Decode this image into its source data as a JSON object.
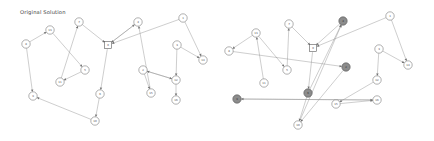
{
  "figure": {
    "width": 434,
    "height": 141,
    "background": "#ffffff",
    "type": "node-link-graph-comparison"
  },
  "colors": {
    "node_fill": "#ffffff",
    "node_stroke": "#6e6e6e",
    "highlight_fill": "#8c8c8c",
    "edge": "#8a8a8a",
    "text": "#3c3c3c",
    "depot_stroke": "#5a5a5a"
  },
  "panels": [
    {
      "id": "left",
      "title": "Original Solution",
      "title_x": 20,
      "title_y": 14,
      "depot": {
        "id": "0",
        "label": "0",
        "x": 108,
        "y": 45
      },
      "nodes": [
        {
          "id": "n7",
          "label": "7",
          "x": 79,
          "y": 22,
          "highlighted": false
        },
        {
          "id": "n13",
          "label": "13",
          "x": 50,
          "y": 30,
          "highlighted": false
        },
        {
          "id": "n8",
          "label": "8",
          "x": 26,
          "y": 44,
          "highlighted": false
        },
        {
          "id": "n9",
          "label": "9",
          "x": 33,
          "y": 96,
          "highlighted": false
        },
        {
          "id": "n10",
          "label": "10",
          "x": 95,
          "y": 121,
          "highlighted": false
        },
        {
          "id": "n5",
          "label": "5",
          "x": 85,
          "y": 70,
          "highlighted": false
        },
        {
          "id": "n11",
          "label": "11",
          "x": 60,
          "y": 82,
          "highlighted": false
        },
        {
          "id": "n6",
          "label": "6",
          "x": 100,
          "y": 94,
          "highlighted": false
        },
        {
          "id": "n4",
          "label": "4",
          "x": 138,
          "y": 22,
          "highlighted": false
        },
        {
          "id": "n1",
          "label": "1",
          "x": 183,
          "y": 18,
          "highlighted": false
        },
        {
          "id": "n3",
          "label": "3",
          "x": 177,
          "y": 45,
          "highlighted": false
        },
        {
          "id": "n14",
          "label": "14",
          "x": 203,
          "y": 60,
          "highlighted": false
        },
        {
          "id": "n2",
          "label": "2",
          "x": 143,
          "y": 70,
          "highlighted": false
        },
        {
          "id": "n12",
          "label": "12",
          "x": 176,
          "y": 80,
          "highlighted": false
        },
        {
          "id": "n15",
          "label": "15",
          "x": 151,
          "y": 93,
          "highlighted": false
        },
        {
          "id": "n16",
          "label": "16",
          "x": 176,
          "y": 100,
          "highlighted": false
        }
      ],
      "edges": [
        {
          "from": "n8",
          "to": "n13"
        },
        {
          "from": "n13",
          "to": "n5"
        },
        {
          "from": "n11",
          "to": "n7"
        },
        {
          "from": "n7",
          "to": "n0"
        },
        {
          "from": "n5",
          "to": "n11"
        },
        {
          "from": "n8",
          "to": "n9"
        },
        {
          "from": "n10",
          "to": "n9"
        },
        {
          "from": "n6",
          "to": "n10"
        },
        {
          "from": "n0",
          "to": "n6"
        },
        {
          "from": "n0",
          "to": "n4"
        },
        {
          "from": "n4",
          "to": "n0"
        },
        {
          "from": "n1",
          "to": "n0"
        },
        {
          "from": "n15",
          "to": "n4"
        },
        {
          "from": "n1",
          "to": "n14"
        },
        {
          "from": "n3",
          "to": "n14"
        },
        {
          "from": "n3",
          "to": "n12"
        },
        {
          "from": "n2",
          "to": "n12"
        },
        {
          "from": "n2",
          "to": "n15"
        },
        {
          "from": "n12",
          "to": "n16"
        },
        {
          "from": "n12",
          "to": "n2"
        }
      ]
    },
    {
      "id": "right",
      "title": "",
      "title_x": 20,
      "title_y": 14,
      "depot": {
        "id": "0",
        "label": "0",
        "x": 96,
        "y": 48
      },
      "nodes": [
        {
          "id": "n7",
          "label": "7",
          "x": 72,
          "y": 24,
          "highlighted": false
        },
        {
          "id": "n13",
          "label": "13",
          "x": 39,
          "y": 33,
          "highlighted": false
        },
        {
          "id": "n8",
          "label": "8",
          "x": 12,
          "y": 51,
          "highlighted": false
        },
        {
          "id": "n9",
          "label": "9",
          "x": 20,
          "y": 99,
          "highlighted": true
        },
        {
          "id": "n10",
          "label": "10",
          "x": 81,
          "y": 125,
          "highlighted": false
        },
        {
          "id": "n5",
          "label": "5",
          "x": 70,
          "y": 70,
          "highlighted": false
        },
        {
          "id": "n11",
          "label": "11",
          "x": 47,
          "y": 83,
          "highlighted": false
        },
        {
          "id": "n6",
          "label": "6",
          "x": 91,
          "y": 93,
          "highlighted": true
        },
        {
          "id": "n4",
          "label": "4",
          "x": 126,
          "y": 21,
          "highlighted": true
        },
        {
          "id": "n1",
          "label": "1",
          "x": 173,
          "y": 16,
          "highlighted": false
        },
        {
          "id": "n3",
          "label": "3",
          "x": 162,
          "y": 49,
          "highlighted": false
        },
        {
          "id": "n14",
          "label": "14",
          "x": 191,
          "y": 65,
          "highlighted": false
        },
        {
          "id": "n2",
          "label": "2",
          "x": 129,
          "y": 67,
          "highlighted": true
        },
        {
          "id": "n12",
          "label": "12",
          "x": 160,
          "y": 80,
          "highlighted": false
        },
        {
          "id": "n15",
          "label": "15",
          "x": 119,
          "y": 104,
          "highlighted": false
        },
        {
          "id": "n16",
          "label": "16",
          "x": 160,
          "y": 100,
          "highlighted": false
        }
      ],
      "edges": [
        {
          "from": "n11",
          "to": "n13"
        },
        {
          "from": "n13",
          "to": "n8"
        },
        {
          "from": "n5",
          "to": "n7"
        },
        {
          "from": "n7",
          "to": "n0"
        },
        {
          "from": "n13",
          "to": "n5"
        },
        {
          "from": "n9",
          "to": "n16"
        },
        {
          "from": "n10",
          "to": "n4"
        },
        {
          "from": "n6",
          "to": "n4"
        },
        {
          "from": "n0",
          "to": "n6"
        },
        {
          "from": "n4",
          "to": "n0"
        },
        {
          "from": "n1",
          "to": "n0"
        },
        {
          "from": "n1",
          "to": "n14"
        },
        {
          "from": "n3",
          "to": "n14"
        },
        {
          "from": "n3",
          "to": "n12"
        },
        {
          "from": "n12",
          "to": "n15"
        },
        {
          "from": "n15",
          "to": "n16"
        },
        {
          "from": "n2",
          "to": "n10"
        },
        {
          "from": "n8",
          "to": "n2"
        },
        {
          "from": "n16",
          "to": "n9"
        },
        {
          "from": "n6",
          "to": "n10"
        }
      ]
    }
  ]
}
